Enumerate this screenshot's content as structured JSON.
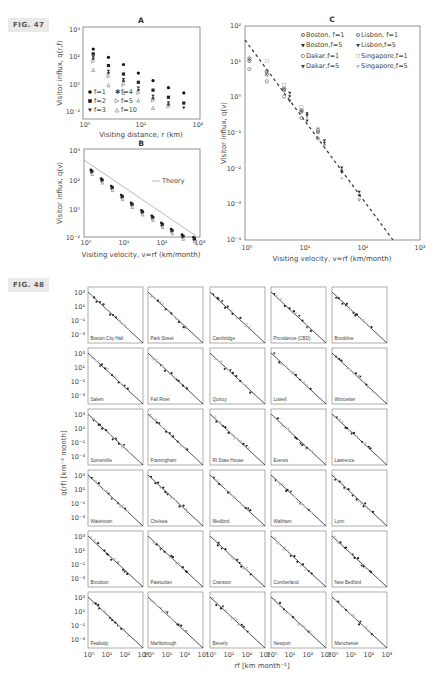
{
  "fig47": {
    "label": "FIG. 47"
  },
  "fig48": {
    "label": "FIG. 48"
  },
  "chart_data": [
    {
      "id": "A",
      "type": "scatter",
      "title": "A",
      "xlabel": "Visiting distance, r (km)",
      "ylabel": "Visitor influx, q(r,f)",
      "xscale": "log",
      "yscale": "log",
      "xlim": [
        1,
        100
      ],
      "ylim": [
        0.01,
        10000
      ],
      "xticks": [
        "10⁰",
        "10¹",
        "10²"
      ],
      "yticks": [
        "10⁻²",
        "10⁰",
        "10²",
        "10⁴"
      ],
      "x": [
        1.4,
        2.6,
        4.8,
        8.8,
        16,
        30,
        56
      ],
      "series": [
        {
          "name": "f=1",
          "marker": "circle-filled",
          "values": [
            400,
            100,
            30,
            7,
            2,
            0.6,
            0.25
          ]
        },
        {
          "name": "f=2",
          "marker": "square-filled",
          "values": [
            180,
            25,
            6,
            1.5,
            0.4,
            0.12,
            0.045
          ]
        },
        {
          "name": "f=3",
          "marker": "triangle-down-filled",
          "values": [
            110,
            10,
            2.5,
            0.6,
            0.15,
            0.05,
            0.02
          ]
        },
        {
          "name": "f=4",
          "marker": "star",
          "values": [
            80,
            7,
            1.8,
            0.4,
            0.1,
            0.035,
            0.015
          ]
        },
        {
          "name": "f=5",
          "marker": "triangle-right-open",
          "values": [
            50,
            4,
            1,
            0.25,
            0.07,
            0.025,
            0.01
          ]
        },
        {
          "name": "f=10",
          "marker": "triangle-up-open",
          "values": [
            12,
            0.9,
            0.25,
            0.07,
            0.02,
            0.008,
            0.005
          ]
        }
      ],
      "legend": {
        "position": "lower-left",
        "entries": [
          "f=1",
          "f=4",
          "f=2",
          "f=5",
          "f=3",
          "f=10"
        ]
      },
      "grid": false
    },
    {
      "id": "B",
      "type": "scatter",
      "title": "B",
      "xlabel": "Visiting velocity, v=rf (km/month)",
      "ylabel": "Visitor influx, q(v)",
      "xscale": "log",
      "yscale": "log",
      "xlim": [
        1,
        1000
      ],
      "ylim": [
        0.01,
        10000
      ],
      "xticks": [
        "10⁰",
        "10¹",
        "10²",
        "10³"
      ],
      "yticks": [
        "10⁻²",
        "10⁰",
        "10²",
        "10⁴"
      ],
      "x": [
        1.4,
        2.6,
        4.8,
        8.8,
        16,
        30,
        56,
        100,
        180,
        350,
        700
      ],
      "values": [
        400,
        100,
        30,
        7,
        2,
        0.6,
        0.25,
        0.08,
        0.03,
        0.012,
        0.008
      ],
      "theory_line": {
        "name": "Theory",
        "x": [
          1,
          700
        ],
        "y": [
          1000,
          0.008
        ]
      },
      "legend": {
        "position": "right",
        "entries": [
          "Theory"
        ]
      },
      "grid": false
    },
    {
      "id": "C",
      "type": "scatter",
      "title": "C",
      "xlabel": "Visiting velocity, v=rf (km/month)",
      "ylabel": "Visitor influx, q(v)",
      "xscale": "log",
      "yscale": "log",
      "xlim": [
        1,
        1000
      ],
      "ylim": [
        0.0001,
        100
      ],
      "xticks": [
        "10⁰",
        "10¹",
        "10²",
        "10³"
      ],
      "yticks": [
        "10⁻⁴",
        "10⁻³",
        "10⁻²",
        "10⁻¹",
        "10⁰",
        "10¹",
        "10²"
      ],
      "series": [
        {
          "name": "Boston, f=1",
          "marker": "circle-dot",
          "x": [
            1.1,
            2.2,
            4.4,
            8.8,
            17
          ],
          "values": [
            12,
            5,
            1.8,
            0.45,
            0.12
          ]
        },
        {
          "name": "Boston,f=5",
          "marker": "triangle-down-filled",
          "x": [
            5.5,
            11,
            22,
            44,
            88
          ],
          "values": [
            1.5,
            0.4,
            0.07,
            0.012,
            0.0025
          ]
        },
        {
          "name": "Dakar,f=1",
          "marker": "circle-open",
          "x": [
            1.1,
            2.2,
            4.4,
            8.8,
            17
          ],
          "values": [
            7,
            3.2,
            1.2,
            0.3,
            0.08
          ]
        },
        {
          "name": "Dakar,f=5",
          "marker": "triangle-down-filled",
          "x": [
            5.5,
            11,
            22,
            44,
            88
          ],
          "values": [
            0.9,
            0.25,
            0.05,
            0.009,
            0.002
          ]
        },
        {
          "name": "Lisbon, f=1",
          "marker": "circle-dot",
          "x": [
            1.1,
            2.2,
            4.4,
            8.8,
            17
          ],
          "values": [
            14,
            6,
            2,
            0.5,
            0.14
          ]
        },
        {
          "name": "Lisbon,f=5",
          "marker": "triangle-down-filled",
          "x": [
            5.5,
            11,
            22,
            44,
            88
          ],
          "values": [
            1.2,
            0.35,
            0.06,
            0.01,
            0.0015
          ]
        },
        {
          "name": "Singapore,f=1",
          "marker": "square-open-light",
          "x": [
            2.2,
            4.4,
            8.8,
            17
          ],
          "values": [
            12,
            2.5,
            0.6,
            0.15
          ]
        },
        {
          "name": "Singapore,f=5",
          "marker": "triangle-down-light",
          "x": [
            11,
            22,
            44,
            88
          ],
          "values": [
            0.3,
            0.05,
            0.006,
            0.0015
          ]
        }
      ],
      "theory_line": {
        "style": "dashed",
        "x": [
          1,
          300
        ],
        "y": [
          40,
          0.0001
        ]
      },
      "legend": {
        "position": "upper-right",
        "entries": [
          "Boston, f=1",
          "Lisbon, f=1",
          "Boston,f=5",
          "Lisbon,f=5",
          "Dakar,f=1",
          "Singapore,f=1",
          "Dakar,f=5",
          "Singapore,f=5"
        ]
      },
      "grid": false
    },
    {
      "id": "FIG48",
      "type": "scatter",
      "title": "",
      "xlabel": "rf [km month⁻¹]",
      "ylabel": "q(rf) [km⁻² month]",
      "xscale": "log",
      "yscale": "log",
      "xlim": [
        1,
        1000
      ],
      "ylim": [
        0.001,
        1000
      ],
      "xticks": [
        "10⁰",
        "10¹",
        "10²",
        "10³"
      ],
      "yticks": [
        "10⁻³",
        "10⁻¹",
        "10¹",
        "10³"
      ],
      "layout": {
        "rows": 6,
        "cols": 5
      },
      "panels": [
        "Boston City Hall",
        "Park Street",
        "Cambridge",
        "Providence (CBD)",
        "Brookline",
        "Salem",
        "Fall River",
        "Quincy",
        "Lowell",
        "Worcester",
        "Somerville",
        "Framingham",
        "RI State House",
        "Everett",
        "Lawrence",
        "Watertown",
        "Chelsea",
        "Medford",
        "Waltham",
        "Lynn",
        "Brockton",
        "Pawtucket",
        "Cranston",
        "Cumberland",
        "New Bedford",
        "Peabody",
        "Marlborough",
        "Beverly",
        "Newport",
        "Manchester"
      ],
      "theory_line": {
        "x": [
          1,
          1000
        ],
        "y": [
          300,
          0.0005
        ]
      },
      "grid": false
    }
  ],
  "panelA": {
    "title": "A",
    "xlabel": "Visiting distance, r (km)",
    "ylabel": "Visitor influx, q(r,f)",
    "xticks": [
      "10⁰",
      "10¹",
      "10²"
    ],
    "yticks": [
      "10⁴",
      "10²",
      "10⁰",
      "10⁻²"
    ],
    "legend": [
      "f=1",
      "f=4",
      "f=2",
      "f=5",
      "f=3",
      "f=10"
    ]
  },
  "panelB": {
    "title": "B",
    "xlabel": "Visiting velocity, v=rf (km/month)",
    "ylabel": "Visitor influx, q(v)",
    "xticks": [
      "10⁰",
      "10¹",
      "10²",
      "10³"
    ],
    "yticks": [
      "10⁴",
      "10²",
      "10⁰",
      "10⁻²"
    ],
    "legend": [
      "Theory"
    ]
  },
  "panelC": {
    "title": "C",
    "xlabel": "Visiting velocity, v=rf (km/month)",
    "ylabel": "Visitor influx, q(v)",
    "xticks": [
      "10⁰",
      "10¹",
      "10²",
      "10³"
    ],
    "yticks": [
      "10²",
      "10¹",
      "10⁰",
      "10⁻¹",
      "10⁻²",
      "10⁻³",
      "10⁻⁴"
    ],
    "legend": [
      "Boston, f=1",
      "Lisbon, f=1",
      "Boston,f=5",
      "Lisbon,f=5",
      "Dakar,f=1",
      "Singapore,f=1",
      "Dakar,f=5",
      "Singapore,f=5"
    ]
  },
  "grid48": {
    "xlabel": "rf [km month⁻¹]",
    "ylabel": "q(rf) [km⁻² month]",
    "xticks": [
      "10⁰",
      "10¹",
      "10²",
      "10³"
    ],
    "yticks": [
      "10³",
      "10¹",
      "10⁻¹",
      "10⁻³"
    ],
    "cities": [
      "Boston City Hall",
      "Park Street",
      "Cambridge",
      "Providence (CBD)",
      "Brookline",
      "Salem",
      "Fall River",
      "Quincy",
      "Lowell",
      "Worcester",
      "Somerville",
      "Framingham",
      "RI State House",
      "Everett",
      "Lawrence",
      "Watertown",
      "Chelsea",
      "Medford",
      "Waltham",
      "Lynn",
      "Brockton",
      "Pawtucket",
      "Cranston",
      "Cumberland",
      "New Bedford",
      "Peabody",
      "Marlborough",
      "Beverly",
      "Newport",
      "Manchester"
    ]
  }
}
